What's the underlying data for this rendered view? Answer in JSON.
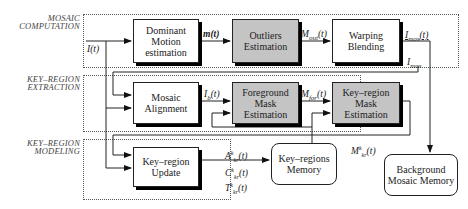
{
  "groups": {
    "mosaic_computation": "MOSAIC\nCOMPUTATION",
    "keyregion_extraction": "KEY–REGION\nEXTRACTION",
    "keyregion_modeling": "KEY–REGION\nMODELING"
  },
  "blocks": {
    "dominant_motion": "Dominant Motion estimation",
    "outliers": "Outliers Estimation",
    "warping": "Warping Blending",
    "mosaic_alignment": "Mosaic Alignment",
    "foreground_mask": "Foreground Mask Estimation",
    "keyregion_mask": "Key–region Mask Estimation",
    "keyregion_update": "Key–region Update",
    "keyregions_memory": "Key–regions Memory",
    "background_memory": "Background Mosaic Memory"
  },
  "signals": {
    "input": "I(t)",
    "motion": "m(t)",
    "m_out": "M_out(t)",
    "i_mos_t": "I_mos(t)",
    "i_mos": "I_mos",
    "i_b": "I_b(t)",
    "m_for": "M_for(t)",
    "m_kr": "M^k_kr(t)",
    "a_kr": "A^k_kr(t)",
    "c_kr": "C^k_kr(t)",
    "t_kr": "T^k_kr(t)"
  },
  "colors": {
    "gray_block": "#c4c4c4",
    "line": "#222222"
  }
}
